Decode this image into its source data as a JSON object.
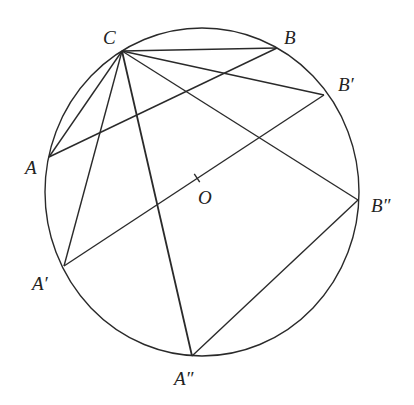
{
  "diagram": {
    "type": "geometry-circle-chords",
    "stroke_color": "#2a2a2a",
    "circle": {
      "cx": 202,
      "cy": 192,
      "rx": 157,
      "ry": 164
    },
    "points": {
      "C": {
        "x": 122,
        "y": 51,
        "label": "C",
        "label_x": 103,
        "label_y": 28
      },
      "B": {
        "x": 277,
        "y": 48,
        "label": "B",
        "label_x": 284,
        "label_y": 28
      },
      "B1": {
        "x": 324,
        "y": 95,
        "label": "B′",
        "label_x": 338,
        "label_y": 75
      },
      "B2": {
        "x": 358,
        "y": 200,
        "label": "B″",
        "label_x": 371,
        "label_y": 196
      },
      "A": {
        "x": 49,
        "y": 157,
        "label": "A",
        "label_x": 25,
        "label_y": 158
      },
      "A1": {
        "x": 64,
        "y": 266,
        "label": "A′",
        "label_x": 32,
        "label_y": 274
      },
      "A2": {
        "x": 192,
        "y": 356,
        "label": "A″",
        "label_x": 174,
        "label_y": 369
      },
      "O": {
        "x": 197,
        "y": 178,
        "label": "O",
        "label_x": 198,
        "label_y": 188
      }
    },
    "segments": [
      {
        "from": "C",
        "to": "A"
      },
      {
        "from": "C",
        "to": "A1"
      },
      {
        "from": "C",
        "to": "A2"
      },
      {
        "from": "C",
        "to": "B"
      },
      {
        "from": "C",
        "to": "B1"
      },
      {
        "from": "C",
        "to": "B2"
      },
      {
        "from": "A",
        "to": "B"
      },
      {
        "from": "A1",
        "to": "B1"
      },
      {
        "from": "A2",
        "to": "B2"
      }
    ],
    "center_tick": {
      "at": "O",
      "on_segment": "A1-B1"
    }
  }
}
